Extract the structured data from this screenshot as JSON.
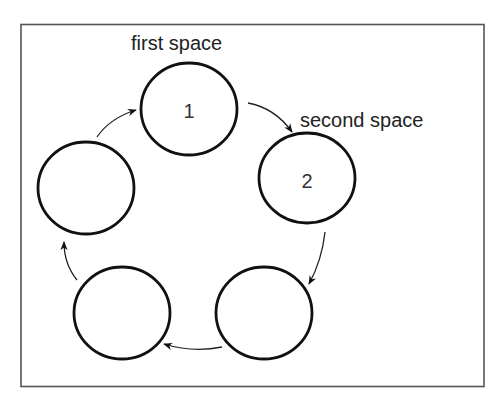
{
  "diagram": {
    "type": "cycle",
    "labels": {
      "first": "first space",
      "second": "second space"
    },
    "nodes": [
      {
        "id": "node-1",
        "label": "1"
      },
      {
        "id": "node-2",
        "label": "2"
      },
      {
        "id": "node-3",
        "label": ""
      },
      {
        "id": "node-4",
        "label": ""
      },
      {
        "id": "node-5",
        "label": ""
      }
    ],
    "edges": [
      {
        "from": "node-1",
        "to": "node-2"
      },
      {
        "from": "node-2",
        "to": "node-3"
      },
      {
        "from": "node-3",
        "to": "node-4"
      },
      {
        "from": "node-4",
        "to": "node-5"
      },
      {
        "from": "node-5",
        "to": "node-1"
      }
    ],
    "direction": "clockwise"
  }
}
